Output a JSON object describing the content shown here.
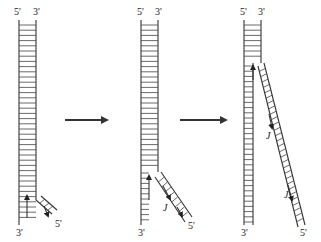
{
  "diagram": {
    "panels": [
      {
        "id": "panel-1",
        "labels": {
          "top_left": "5'",
          "top_right": "3'",
          "bottom_left": "3'",
          "branch_end": "5'"
        },
        "okazaki_labels": []
      },
      {
        "id": "panel-2",
        "labels": {
          "top_left": "5'",
          "top_right": "3'",
          "bottom_left": "3'",
          "branch_end": "5'"
        },
        "okazaki_labels": [
          "J"
        ]
      },
      {
        "id": "panel-3",
        "labels": {
          "top_left": "5'",
          "top_right": "3'",
          "bottom_left": "3'",
          "branch_end": "5'"
        },
        "okazaki_labels": [
          "J",
          "J"
        ]
      }
    ],
    "arrows": [
      "step-arrow-1",
      "step-arrow-2"
    ],
    "colors": {
      "line": "#333333",
      "background": "#ffffff"
    }
  }
}
